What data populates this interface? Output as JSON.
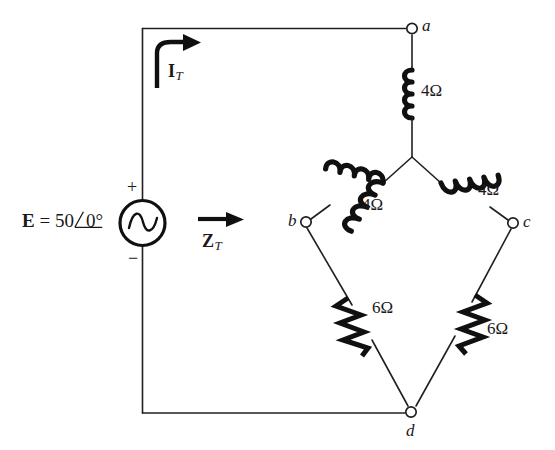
{
  "figure": {
    "background_color": "#ffffff",
    "ink_color": "#1a1818"
  },
  "source": {
    "label_prefix": "E",
    "equals": "=",
    "magnitude": "50",
    "angle": "0°",
    "full_label": "E = 50 ∠0°",
    "plus_sign": "+",
    "minus_sign": "−",
    "symbol_name": "ac-voltage-source"
  },
  "annotations": {
    "current": {
      "symbol": "I",
      "subscript": "T",
      "name": "total-current"
    },
    "impedance": {
      "symbol": "Z",
      "subscript": "T",
      "name": "total-impedance"
    }
  },
  "nodes": [
    {
      "id": "a",
      "label": "a",
      "x": 412,
      "y": 28
    },
    {
      "id": "b",
      "label": "b",
      "x": 305,
      "y": 221
    },
    {
      "id": "c",
      "label": "c",
      "x": 513,
      "y": 222
    },
    {
      "id": "d",
      "label": "d",
      "x": 411,
      "y": 413
    }
  ],
  "components": [
    {
      "id": "L1",
      "type": "inductor",
      "value": "4Ω",
      "orientation": "vertical",
      "between": [
        "a",
        "center"
      ],
      "name": "inductor-top"
    },
    {
      "id": "L2",
      "type": "inductor",
      "value": "4Ω",
      "orientation": "diagonal-left",
      "between": [
        "center",
        "b"
      ],
      "name": "inductor-left"
    },
    {
      "id": "L3",
      "type": "inductor",
      "value": "4Ω",
      "orientation": "diagonal-right",
      "between": [
        "center",
        "c"
      ],
      "name": "inductor-right"
    },
    {
      "id": "R1",
      "type": "resistor",
      "value": "6Ω",
      "orientation": "diagonal-left",
      "between": [
        "b",
        "d"
      ],
      "name": "resistor-left"
    },
    {
      "id": "R2",
      "type": "resistor",
      "value": "6Ω",
      "orientation": "diagonal-right",
      "between": [
        "c",
        "d"
      ],
      "name": "resistor-right"
    }
  ],
  "values": {
    "inductor_top": "4Ω",
    "inductor_left": "4Ω",
    "inductor_right": "4Ω",
    "resistor_left": "6Ω",
    "resistor_right": "6Ω"
  }
}
